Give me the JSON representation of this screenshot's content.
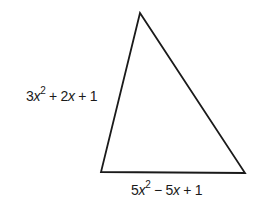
{
  "figure": {
    "shape": "triangle",
    "vertices": {
      "top": [
        140,
        13
      ],
      "bottom_left": [
        101,
        172
      ],
      "bottom_right": [
        245,
        173
      ]
    },
    "stroke_color": "#1a1a1a",
    "labels": {
      "left_side": {
        "coef1": "3",
        "var1": "x",
        "exp1": "2",
        "op1": "+",
        "coef2": "2",
        "var2": "x",
        "op2": "+",
        "const": "1",
        "text": "3x^2 + 2x + 1"
      },
      "bottom_side": {
        "coef1": "5",
        "var1": "x",
        "exp1": "2",
        "op1": "−",
        "coef2": "5",
        "var2": "x",
        "op2": "+",
        "const": "1",
        "text": "5x^2 − 5x + 1"
      }
    }
  }
}
